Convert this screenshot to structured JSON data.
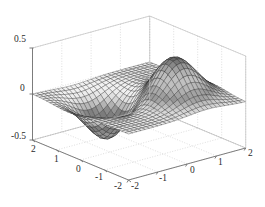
{
  "figure": {
    "title": "",
    "background": "#ffffff",
    "axis_color": "#6e6e6e",
    "grid_color": "#c8c8c8",
    "mesh_color": "#202020"
  },
  "chart_data": {
    "type": "surface",
    "title": "",
    "xlabel": "",
    "ylabel": "",
    "zlabel": "",
    "function": "peaks-like gaussian surface: one positive peak (back-right) and one negative trough (front-left)",
    "colormap": "gray",
    "shading": "faceted",
    "grid": true,
    "legend": null,
    "view": {
      "azimuth": -37.5,
      "elevation": 30
    },
    "xlim": [
      -2,
      2
    ],
    "ylim": [
      -2,
      2
    ],
    "zlim": [
      -0.5,
      0.5
    ],
    "xticks": [
      -2,
      -1,
      0,
      1,
      2
    ],
    "yticks": [
      -2,
      -1,
      0,
      1,
      2
    ],
    "zticks": [
      -0.5,
      0,
      0.5
    ],
    "xticklabels": [
      "-2",
      "-1",
      "0",
      "1",
      "2"
    ],
    "yticklabels": [
      "2",
      "1",
      "0",
      "-1",
      "-2"
    ],
    "zticklabels": [
      "0.5",
      "0",
      "-0.5"
    ],
    "grid_n": 28,
    "peak": {
      "x": 0.7,
      "y": -0.6,
      "z": 0.45,
      "sigma": 0.62
    },
    "trough": {
      "x": -0.65,
      "y": 0.55,
      "z": -0.45,
      "sigma": 0.6
    },
    "zero_plane": 0
  },
  "zticklabels": {
    "t0": "0.5",
    "t1": "0",
    "t2": "-0.5"
  },
  "yticklabels": {
    "t0": "2",
    "t1": "1",
    "t2": "0",
    "t3": "-1",
    "t4": "-2"
  },
  "xticklabels": {
    "t0": "-2",
    "t1": "-1",
    "t2": "0",
    "t3": "1",
    "t4": "2"
  }
}
